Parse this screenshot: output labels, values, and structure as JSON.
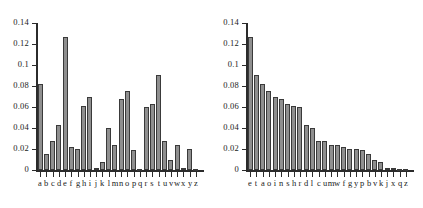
{
  "figure": {
    "title": "",
    "background": "#ffffff",
    "bar_fill": "#8f8f8f",
    "bar_stroke": "#3a3a3a",
    "axis_color": "#2b2b2b"
  },
  "chart_data": [
    {
      "type": "bar",
      "id": "letter-frequency-alphabetical",
      "title": "",
      "subtitle": "",
      "xlabel": "",
      "ylabel": "",
      "ylim": [
        0,
        0.14
      ],
      "xlim_note": "26 categories, alphabetical order",
      "grid": false,
      "legend": null,
      "ytick_labels": [
        "0",
        "0.02",
        "0.04",
        "0.06",
        "0.08",
        "0.1",
        "0.12",
        "0.14"
      ],
      "ytick_values": [
        0,
        0.02,
        0.04,
        0.06,
        0.08,
        0.1,
        0.12,
        0.14
      ],
      "categories": [
        "a",
        "b",
        "c",
        "d",
        "e",
        "f",
        "g",
        "h",
        "i",
        "j",
        "k",
        "l",
        "m",
        "n",
        "o",
        "p",
        "q",
        "r",
        "s",
        "t",
        "u",
        "v",
        "w",
        "x",
        "y",
        "z"
      ],
      "values": [
        0.0817,
        0.0149,
        0.0278,
        0.0425,
        0.127,
        0.0223,
        0.0202,
        0.0609,
        0.0697,
        0.0015,
        0.0077,
        0.0403,
        0.0241,
        0.0675,
        0.0751,
        0.0193,
        0.001,
        0.0599,
        0.0633,
        0.0906,
        0.0276,
        0.0098,
        0.0236,
        0.0015,
        0.0197,
        0.0007
      ]
    },
    {
      "type": "bar",
      "id": "letter-frequency-sorted",
      "title": "",
      "subtitle": "",
      "xlabel": "",
      "ylabel": "",
      "ylim": [
        0,
        0.14
      ],
      "xlim_note": "26 categories, descending frequency order",
      "grid": false,
      "legend": null,
      "ytick_labels": [
        "0",
        "0.02",
        "0.04",
        "0.06",
        "0.08",
        "0.1",
        "0.12",
        "0.14"
      ],
      "ytick_values": [
        0,
        0.02,
        0.04,
        0.06,
        0.08,
        0.1,
        0.12,
        0.14
      ],
      "categories": [
        "e",
        "t",
        "a",
        "o",
        "i",
        "n",
        "s",
        "h",
        "r",
        "d",
        "l",
        "c",
        "u",
        "m",
        "w",
        "f",
        "g",
        "y",
        "p",
        "b",
        "v",
        "k",
        "j",
        "x",
        "q",
        "z"
      ],
      "values": [
        0.127,
        0.0906,
        0.0817,
        0.0751,
        0.0697,
        0.0675,
        0.0633,
        0.0609,
        0.0599,
        0.0425,
        0.0403,
        0.0278,
        0.0276,
        0.0241,
        0.0236,
        0.0223,
        0.0202,
        0.0197,
        0.0193,
        0.0149,
        0.0098,
        0.0077,
        0.0015,
        0.0015,
        0.001,
        0.0007
      ]
    }
  ]
}
